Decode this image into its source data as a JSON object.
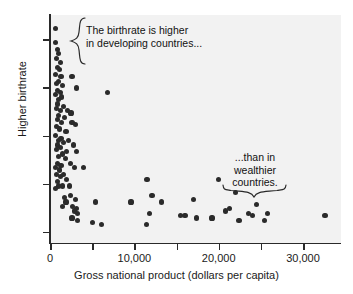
{
  "chart_data": {
    "type": "scatter",
    "title": "",
    "xlabel": "Gross national product (dollars per capita)",
    "ylabel": "Higher birthrate",
    "xlim": [
      0,
      34500
    ],
    "ylim": [
      0,
      100
    ],
    "grid": false,
    "legend": null,
    "xticks": [
      0,
      5000,
      10000,
      15000,
      20000,
      25000,
      30000
    ],
    "xtick_labels": [
      "0",
      "",
      "10,000",
      "",
      "20,000",
      "",
      "30,000"
    ],
    "ytick_labels": [
      "",
      "",
      "",
      "",
      ""
    ],
    "yticks_unlabeled": true,
    "marker_color": "#2b2b2b",
    "plot_background": "#f2f2f2",
    "axis_color": "#2a2a2a",
    "points": [
      [
        700,
        94
      ],
      [
        700,
        88
      ],
      [
        900,
        85
      ],
      [
        1000,
        83
      ],
      [
        800,
        81
      ],
      [
        1200,
        79
      ],
      [
        900,
        77
      ],
      [
        1100,
        76
      ],
      [
        700,
        74
      ],
      [
        1300,
        73
      ],
      [
        2600,
        73
      ],
      [
        1000,
        71
      ],
      [
        800,
        70
      ],
      [
        1500,
        69
      ],
      [
        3100,
        68
      ],
      [
        900,
        67
      ],
      [
        1200,
        66
      ],
      [
        700,
        65
      ],
      [
        1400,
        64
      ],
      [
        1000,
        63
      ],
      [
        6800,
        66
      ],
      [
        900,
        61
      ],
      [
        1600,
        60
      ],
      [
        800,
        59
      ],
      [
        1200,
        58
      ],
      [
        2100,
        58
      ],
      [
        2500,
        57
      ],
      [
        1000,
        56
      ],
      [
        1700,
        55
      ],
      [
        900,
        54
      ],
      [
        1400,
        53
      ],
      [
        2600,
        53
      ],
      [
        3000,
        52
      ],
      [
        800,
        51
      ],
      [
        1100,
        50
      ],
      [
        1900,
        49
      ],
      [
        700,
        47
      ],
      [
        1300,
        46
      ],
      [
        1000,
        45
      ],
      [
        2200,
        45
      ],
      [
        1600,
        44
      ],
      [
        900,
        43
      ],
      [
        2800,
        43
      ],
      [
        1200,
        42
      ],
      [
        800,
        41
      ],
      [
        2000,
        40
      ],
      [
        3100,
        40
      ],
      [
        1500,
        39
      ],
      [
        1000,
        38
      ],
      [
        1800,
        37
      ],
      [
        900,
        35
      ],
      [
        2400,
        35
      ],
      [
        1300,
        34
      ],
      [
        700,
        33
      ],
      [
        2900,
        33
      ],
      [
        1100,
        32
      ],
      [
        4000,
        33
      ],
      [
        800,
        30
      ],
      [
        1600,
        30
      ],
      [
        1200,
        29
      ],
      [
        2000,
        28
      ],
      [
        900,
        27
      ],
      [
        1000,
        25
      ],
      [
        1500,
        25
      ],
      [
        2300,
        25
      ],
      [
        700,
        24
      ],
      [
        11500,
        28
      ],
      [
        20000,
        28
      ],
      [
        2400,
        21
      ],
      [
        1700,
        20
      ],
      [
        3000,
        19
      ],
      [
        1900,
        18
      ],
      [
        22000,
        22
      ],
      [
        1500,
        16
      ],
      [
        2700,
        16
      ],
      [
        3100,
        15
      ],
      [
        2900,
        14
      ],
      [
        3300,
        13
      ],
      [
        5400,
        18
      ],
      [
        9600,
        18
      ],
      [
        12100,
        21
      ],
      [
        13200,
        18
      ],
      [
        17000,
        19
      ],
      [
        11800,
        13
      ],
      [
        20800,
        14
      ],
      [
        21300,
        15
      ],
      [
        23500,
        13
      ],
      [
        24500,
        17
      ],
      [
        25800,
        13
      ],
      [
        15500,
        12
      ],
      [
        16000,
        12
      ],
      [
        17400,
        11
      ],
      [
        19200,
        11
      ],
      [
        22400,
        10
      ],
      [
        24000,
        12
      ],
      [
        25400,
        10
      ],
      [
        32600,
        12
      ],
      [
        5000,
        9
      ],
      [
        6100,
        8
      ],
      [
        11400,
        8
      ],
      [
        2600,
        11
      ],
      [
        3300,
        10
      ]
    ]
  },
  "annotations": [
    {
      "id": "annotation-developing",
      "lines": "The birthrate is higher\nin developing countries...",
      "brace": "left-curly-brace"
    },
    {
      "id": "annotation-wealthy",
      "lines": "...than in\nwealthier\ncountries.",
      "brace": "bottom-curly-brace"
    }
  ]
}
